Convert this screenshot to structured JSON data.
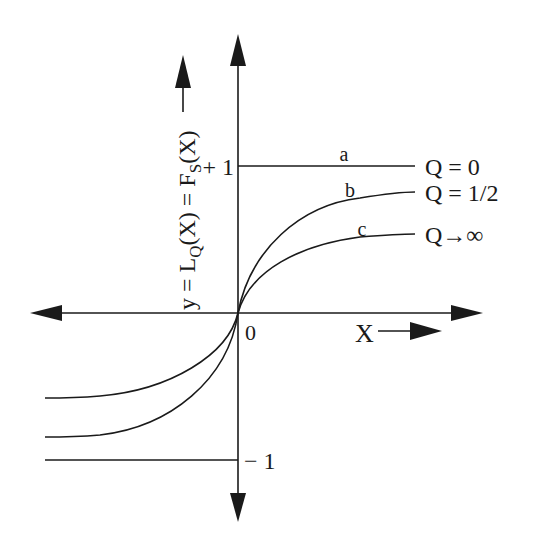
{
  "diagram": {
    "type": "function-plot",
    "axes": {
      "x_label": "X",
      "y_label_main": "y = L",
      "y_label_sub_Q": "Q",
      "y_label_mid": "(X) = F",
      "y_label_sub_S": "S",
      "y_label_end": "(X)",
      "origin_label": "0",
      "y_tick_pos": "+ 1",
      "y_tick_neg": "− 1"
    },
    "curves": [
      {
        "id": "a",
        "label": "a",
        "legend": "Q = 0"
      },
      {
        "id": "b",
        "label": "b",
        "legend": "Q = 1/2"
      },
      {
        "id": "c",
        "label": "c",
        "legend": "Q→∞"
      }
    ],
    "colors": {
      "ink": "#1a1a1a",
      "background": "#ffffff"
    }
  }
}
